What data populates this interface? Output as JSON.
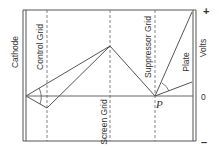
{
  "diagram": {
    "title": "",
    "labels": {
      "cathode": "Cathode",
      "control_grid": "Control Grid",
      "screen_grid": "Screen Grid",
      "suppressor_grid": "Suppressor Grid",
      "plate": "Plate",
      "volts": "Volts",
      "point_p": "P",
      "plus": "+",
      "zero": "0",
      "minus": "–"
    },
    "colors": {
      "line": "#555555",
      "text": "#333333",
      "background": "#ffffff"
    },
    "electrodes": [
      {
        "name": "Cathode",
        "x": 25,
        "style": "double-solid"
      },
      {
        "name": "Control Grid",
        "x": 47,
        "style": "dashed"
      },
      {
        "name": "Screen Grid",
        "x": 110,
        "style": "dashed"
      },
      {
        "name": "Suppressor Grid",
        "x": 155,
        "style": "dashed"
      },
      {
        "name": "Plate",
        "x": 194,
        "style": "double-solid"
      }
    ],
    "potential_curves": [
      {
        "name": "high-plate-voltage",
        "points": [
          [
            26,
            96
          ],
          [
            110,
            46
          ],
          [
            155,
            96
          ],
          [
            192,
            12
          ]
        ]
      },
      {
        "name": "low-plate-voltage",
        "points": [
          [
            26,
            96
          ],
          [
            47,
            108
          ],
          [
            110,
            46
          ],
          [
            155,
            96
          ],
          [
            192,
            82
          ]
        ]
      }
    ],
    "zero_line_y": 96
  }
}
